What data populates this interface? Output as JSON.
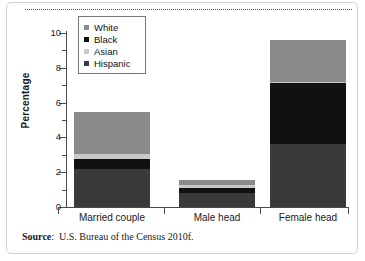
{
  "figure": {
    "source_label": "Source",
    "source_separator": ":",
    "source_text": "U.S. Bureau of the Census 2010f."
  },
  "chart_data": {
    "type": "bar",
    "stacked": true,
    "title": "",
    "subtitle": "",
    "xlabel": "",
    "ylabel": "Percentage",
    "categories": [
      "Married couple",
      "Male head",
      "Female head"
    ],
    "ylim": [
      0,
      10
    ],
    "y_ticks_major": [
      0,
      2,
      4,
      6,
      8,
      10
    ],
    "y_tick_labels": [
      "0",
      "2",
      "4",
      "6",
      "8",
      "10"
    ],
    "y_ticks_minor": [
      1,
      3,
      5,
      7,
      9
    ],
    "grid": false,
    "legend_position": "upper-left-inside",
    "series": [
      {
        "name": "Hispanic",
        "color": "#3a3a3a",
        "values": [
          2.2,
          0.8,
          3.6
        ]
      },
      {
        "name": "Black",
        "color": "#111111",
        "values": [
          0.55,
          0.3,
          3.5
        ]
      },
      {
        "name": "Asian",
        "color": "#c8c8c8",
        "values": [
          0.3,
          0.15,
          0.1
        ]
      },
      {
        "name": "White",
        "color": "#8a8a8a",
        "values": [
          2.4,
          0.3,
          2.4
        ]
      }
    ],
    "totals": [
      5.45,
      1.55,
      9.6
    ],
    "legend_order": [
      "White",
      "Black",
      "Asian",
      "Hispanic"
    ]
  },
  "legend": {
    "entries": [
      {
        "label": "White",
        "color": "#8a8a8a"
      },
      {
        "label": "Black",
        "color": "#111111"
      },
      {
        "label": "Asian",
        "color": "#c8c8c8"
      },
      {
        "label": "Hispanic",
        "color": "#3a3a3a"
      }
    ]
  }
}
